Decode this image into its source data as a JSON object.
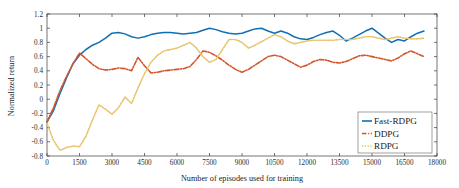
{
  "chart_data": {
    "type": "line",
    "title": "",
    "xlabel": "Number of episodes used for training",
    "ylabel": "Normalized return",
    "xlim": [
      0,
      18000
    ],
    "ylim": [
      -0.8,
      1.2
    ],
    "xticks": [
      0,
      1500,
      3000,
      4500,
      6000,
      7500,
      9000,
      10500,
      12000,
      13500,
      15000,
      16500,
      18000
    ],
    "xtick_labels": [
      "0",
      "1500",
      "3000",
      "4500",
      "6000",
      "7500",
      "9000",
      "10500",
      "12000",
      "13500",
      "15000",
      "16500",
      "18000"
    ],
    "yticks": [
      -0.8,
      -0.6,
      -0.4,
      -0.2,
      0,
      0.2,
      0.4,
      0.6,
      0.8,
      1,
      1.2
    ],
    "ytick_labels": [
      "-0.8",
      "-0.6",
      "-0.4",
      "-0.2",
      "0",
      "0.2",
      "0.4",
      "0.6",
      "0.8",
      "1",
      "1.2"
    ],
    "grid": false,
    "legend_position": "lower right",
    "series": [
      {
        "name": "Fast-RDPG",
        "color": "#0f6fb4",
        "style": "solid",
        "x": [
          0,
          300,
          600,
          900,
          1200,
          1500,
          1800,
          2100,
          2400,
          2700,
          3000,
          3300,
          3600,
          3900,
          4200,
          4500,
          4800,
          5100,
          5400,
          5700,
          6000,
          6300,
          6600,
          6900,
          7200,
          7500,
          7800,
          8100,
          8400,
          8700,
          9000,
          9300,
          9600,
          9900,
          10200,
          10500,
          10800,
          11100,
          11400,
          11700,
          12000,
          12300,
          12600,
          12900,
          13200,
          13500,
          13800,
          14100,
          14400,
          14700,
          15000,
          15300,
          15600,
          15900,
          16200,
          16500,
          16800,
          17100,
          17400
        ],
        "y": [
          -0.32,
          -0.16,
          0.08,
          0.3,
          0.5,
          0.62,
          0.7,
          0.76,
          0.8,
          0.86,
          0.93,
          0.94,
          0.92,
          0.88,
          0.86,
          0.88,
          0.91,
          0.93,
          0.94,
          0.94,
          0.93,
          0.92,
          0.93,
          0.94,
          0.97,
          1.0,
          0.98,
          0.95,
          0.93,
          0.92,
          0.93,
          0.96,
          0.99,
          1.0,
          0.96,
          0.93,
          0.96,
          0.93,
          0.88,
          0.85,
          0.84,
          0.87,
          0.91,
          0.94,
          0.96,
          0.9,
          0.82,
          0.86,
          0.91,
          0.96,
          1.0,
          0.93,
          0.86,
          0.8,
          0.84,
          0.82,
          0.88,
          0.93,
          0.96
        ]
      },
      {
        "name": "DDPG",
        "color": "#d4552b",
        "style": "dashdot",
        "x": [
          0,
          300,
          600,
          900,
          1200,
          1500,
          1800,
          2100,
          2400,
          2700,
          3000,
          3300,
          3600,
          3900,
          4200,
          4500,
          4800,
          5100,
          5400,
          5700,
          6000,
          6300,
          6600,
          6900,
          7200,
          7500,
          7800,
          8100,
          8400,
          8700,
          9000,
          9300,
          9600,
          9900,
          10200,
          10500,
          10800,
          11100,
          11400,
          11700,
          12000,
          12300,
          12600,
          12900,
          13200,
          13500,
          13800,
          14100,
          14400,
          14700,
          15000,
          15300,
          15600,
          15900,
          16200,
          16500,
          16800,
          17100,
          17400
        ],
        "y": [
          -0.32,
          -0.12,
          0.12,
          0.32,
          0.5,
          0.65,
          0.57,
          0.49,
          0.43,
          0.41,
          0.42,
          0.44,
          0.43,
          0.4,
          0.59,
          0.47,
          0.37,
          0.38,
          0.4,
          0.41,
          0.42,
          0.43,
          0.46,
          0.56,
          0.68,
          0.66,
          0.61,
          0.55,
          0.48,
          0.42,
          0.38,
          0.42,
          0.48,
          0.54,
          0.6,
          0.62,
          0.6,
          0.55,
          0.5,
          0.45,
          0.48,
          0.53,
          0.56,
          0.55,
          0.52,
          0.51,
          0.53,
          0.57,
          0.61,
          0.62,
          0.6,
          0.58,
          0.56,
          0.54,
          0.58,
          0.64,
          0.68,
          0.64,
          0.6
        ]
      },
      {
        "name": "RDPG",
        "color": "#e8c36a",
        "style": "dotted",
        "x": [
          0,
          300,
          600,
          900,
          1200,
          1500,
          1800,
          2100,
          2400,
          2700,
          3000,
          3300,
          3600,
          3900,
          4200,
          4500,
          4800,
          5100,
          5400,
          5700,
          6000,
          6300,
          6600,
          6900,
          7200,
          7500,
          7800,
          8100,
          8400,
          8700,
          9000,
          9300,
          9600,
          9900,
          10200,
          10500,
          10800,
          11100,
          11400,
          11700,
          12000,
          12300,
          12600,
          12900,
          13200,
          13500,
          13800,
          14100,
          14400,
          14700,
          15000,
          15300,
          15600,
          15900,
          16200,
          16500,
          16800,
          17100,
          17400
        ],
        "y": [
          -0.34,
          -0.58,
          -0.72,
          -0.68,
          -0.66,
          -0.67,
          -0.52,
          -0.29,
          -0.08,
          -0.14,
          -0.21,
          -0.12,
          0.03,
          -0.06,
          0.16,
          0.36,
          0.52,
          0.62,
          0.68,
          0.7,
          0.72,
          0.76,
          0.8,
          0.72,
          0.6,
          0.52,
          0.56,
          0.7,
          0.84,
          0.84,
          0.8,
          0.72,
          0.76,
          0.81,
          0.86,
          0.91,
          0.88,
          0.82,
          0.78,
          0.8,
          0.82,
          0.83,
          0.83,
          0.83,
          0.83,
          0.84,
          0.84,
          0.84,
          0.86,
          0.88,
          0.88,
          0.86,
          0.84,
          0.86,
          0.88,
          0.86,
          0.85,
          0.85,
          0.86
        ]
      }
    ]
  },
  "legend": {
    "items": [
      {
        "label": "Fast-RDPG"
      },
      {
        "label": "DDPG"
      },
      {
        "label": "RDPG"
      }
    ]
  }
}
